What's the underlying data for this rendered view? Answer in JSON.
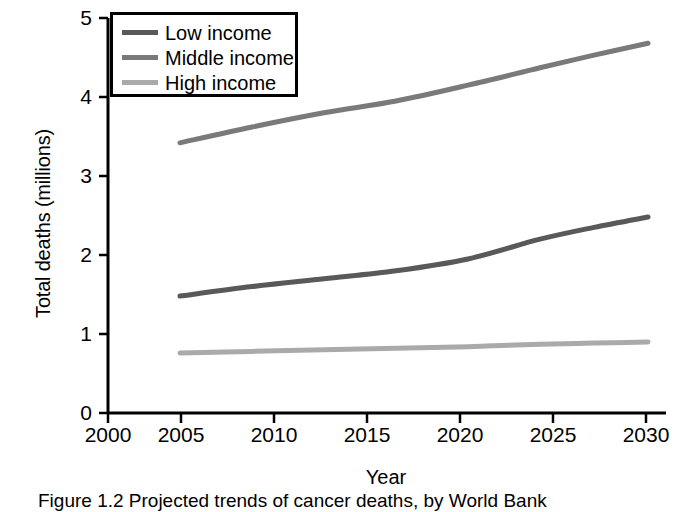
{
  "chart_data": {
    "type": "line",
    "title": "",
    "xlabel": "Year",
    "ylabel": "Total deaths (millions)",
    "xlim": [
      2000,
      2031
    ],
    "ylim": [
      0,
      5
    ],
    "xticks": [
      2000,
      2005,
      2010,
      2015,
      2020,
      2025,
      2030
    ],
    "yticks": [
      0,
      1,
      2,
      3,
      4,
      5
    ],
    "grid": false,
    "legend_position": "top-left",
    "x": [
      2004,
      2008,
      2012,
      2016,
      2020,
      2024,
      2027,
      2030
    ],
    "series": [
      {
        "name": "Low income",
        "color": "#595959",
        "values": [
          1.48,
          1.6,
          1.7,
          1.8,
          1.95,
          2.2,
          2.35,
          2.48
        ]
      },
      {
        "name": "Middle income",
        "color": "#7a7a7a",
        "values": [
          3.42,
          3.62,
          3.8,
          3.95,
          4.15,
          4.37,
          4.53,
          4.68
        ]
      },
      {
        "name": "High income",
        "color": "#aaaaaa",
        "values": [
          0.76,
          0.78,
          0.8,
          0.82,
          0.84,
          0.87,
          0.885,
          0.9
        ]
      }
    ]
  },
  "axes": {
    "ylabel": "Total deaths (millions)",
    "xlabel": "Year",
    "ytick_labels": [
      "0",
      "1",
      "2",
      "3",
      "4",
      "5"
    ],
    "xtick_labels": [
      "2000",
      "2005",
      "2010",
      "2015",
      "2020",
      "2025",
      "2030"
    ]
  },
  "legend": {
    "items": [
      {
        "label": "Low income",
        "color": "#595959"
      },
      {
        "label": "Middle income",
        "color": "#7a7a7a"
      },
      {
        "label": "High income",
        "color": "#aaaaaa"
      }
    ]
  },
  "caption": {
    "text": "Figure 1.2  Projected trends of cancer deaths, by World Bank"
  },
  "colors": {
    "axis": "#000000",
    "background": "#ffffff",
    "low_income": "#595959",
    "middle_income": "#7a7a7a",
    "high_income": "#aaaaaa"
  }
}
